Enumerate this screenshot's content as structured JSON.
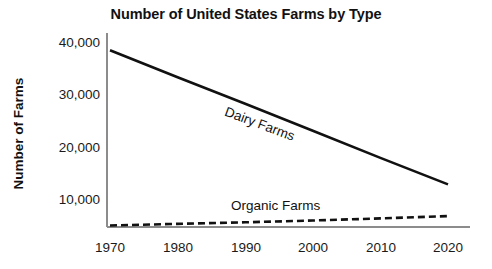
{
  "chart_data": {
    "type": "line",
    "title": "Number of United States Farms by Type",
    "xlabel": "",
    "ylabel": "Number of Farms",
    "x": [
      1970,
      1980,
      1990,
      2000,
      2010,
      2020
    ],
    "xtick_labels": [
      "1970",
      "1980",
      "1990",
      "2000",
      "2010",
      "2020"
    ],
    "ytick_labels": [
      "10,000",
      "20,000",
      "30,000",
      "40,000"
    ],
    "ytick_values": [
      10000,
      20000,
      30000,
      40000
    ],
    "xlim": [
      1970,
      2020
    ],
    "ylim": [
      0,
      40000
    ],
    "grid": false,
    "legend_position": "inline-labels",
    "series": [
      {
        "name": "Dairy Farms",
        "style": "solid",
        "color": "#111111",
        "values": [
          34000,
          28800,
          23700,
          18500,
          13300,
          8200
        ]
      },
      {
        "name": "Organic Farms",
        "style": "dashed",
        "color": "#111111",
        "values": [
          300,
          600,
          900,
          1250,
          1650,
          2100
        ]
      }
    ],
    "annotations": [
      {
        "text": "Dairy Farms",
        "x": 1995,
        "y": 21000,
        "rotation": 20.5
      },
      {
        "text": "Organic Farms",
        "x": 1995,
        "y": 4200,
        "rotation": 0
      }
    ]
  },
  "axes": {
    "axis_color": "#8c8c8c",
    "y_title": "Number of Farms",
    "chart_title": "Number of United States Farms by Type"
  }
}
